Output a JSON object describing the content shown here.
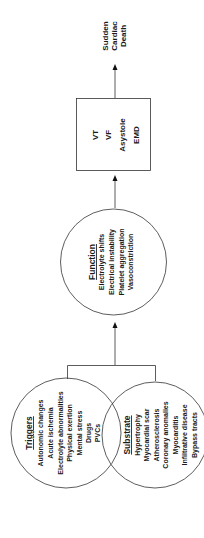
{
  "outcome": {
    "lines": [
      "Sudden",
      "Cardiac",
      "Death"
    ]
  },
  "arrhythmia_box": {
    "lines": [
      "VT",
      "VF",
      "Asystole",
      "EMD"
    ]
  },
  "function_circle": {
    "title": "Function",
    "items": [
      "Electrolyte shifts",
      "Electrical instability",
      "Platelet aggregation",
      "Vasoconstriction"
    ]
  },
  "triggers_circle": {
    "title": "Triggers",
    "items": [
      "Autonomic changes",
      "Acute ischemia",
      "Electrolyte abnormalities",
      "Physical exertion",
      "Mental stress",
      "Drugs",
      "PVCs"
    ]
  },
  "substrate_circle": {
    "title": "Substrate",
    "items": [
      "Hypertrophy",
      "Myocardial scar",
      "Atherosclerosis",
      "Coronary anomalies",
      "Myocarditis",
      "Infiltrative disease",
      "Bypass tracts"
    ]
  },
  "colors": {
    "line": "#333333",
    "text": "#1a1a1a",
    "background": "#ffffff"
  }
}
